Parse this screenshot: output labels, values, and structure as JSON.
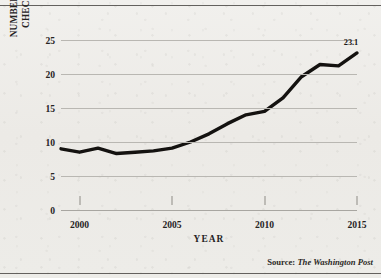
{
  "figure": {
    "background_color": "#eeedea",
    "ink_color": "#141210"
  },
  "axes": {
    "y_title_line1": "NUMBER OF BACKGROUND",
    "y_title_line2": "CHECKS (IN MILLIONS)",
    "x_title": "YEAR",
    "y_ticks": [
      "0",
      "5",
      "10",
      "15",
      "20",
      "25"
    ],
    "x_ticks": [
      "2000",
      "2005",
      "2010",
      "2015"
    ]
  },
  "source": {
    "prefix": "Source:",
    "publication": "The Washington Post"
  },
  "annotation": {
    "endpoint_value": "23.1"
  },
  "chart_data": {
    "type": "line",
    "title": "",
    "xlabel": "YEAR",
    "ylabel": "NUMBER OF BACKGROUND CHECKS (IN MILLIONS)",
    "xlim": [
      1999,
      2015
    ],
    "ylim": [
      0,
      25
    ],
    "yticks": [
      0,
      5,
      10,
      15,
      20,
      25
    ],
    "xticks": [
      2000,
      2005,
      2010,
      2015
    ],
    "grid": "horizontal",
    "legend": "none",
    "line_color": "#141210",
    "line_width": 3.4,
    "x": [
      1999,
      2000,
      2001,
      2002,
      2003,
      2004,
      2005,
      2006,
      2007,
      2008,
      2009,
      2010,
      2011,
      2012,
      2013,
      2014,
      2015
    ],
    "values": [
      9.0,
      8.5,
      9.1,
      8.3,
      8.5,
      8.7,
      9.1,
      10.0,
      11.2,
      12.7,
      14.0,
      14.5,
      16.5,
      19.6,
      21.4,
      21.2,
      23.1
    ],
    "annotations": [
      {
        "label": "23.1",
        "x": 2015,
        "y": 23.1
      }
    ],
    "source": "Source: The Washington Post"
  }
}
